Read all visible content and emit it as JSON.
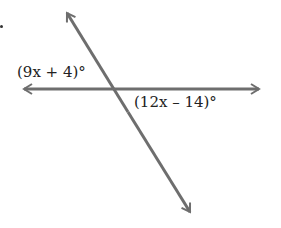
{
  "figure": {
    "type": "intersecting-lines",
    "labels": {
      "angle_left": "(9x + 4)°",
      "angle_right": "(12x – 14)°"
    },
    "line_color": "#6e6e6e"
  }
}
